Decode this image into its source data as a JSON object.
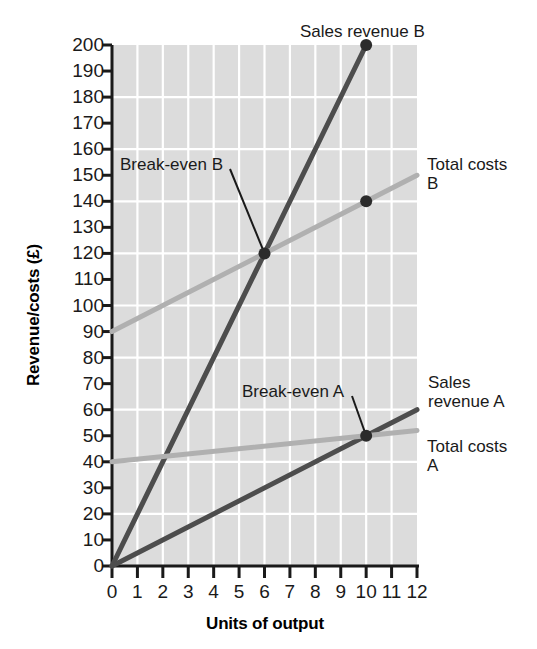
{
  "chart_data": {
    "type": "line",
    "title": "",
    "xlabel": "Units of output",
    "ylabel": "Revenue/costs (£)",
    "xlim": [
      0,
      12
    ],
    "ylim": [
      0,
      200
    ],
    "grid": true,
    "legend_position": "inline-labels",
    "x_ticks": [
      "0",
      "1",
      "2",
      "3",
      "4",
      "5",
      "6",
      "7",
      "8",
      "9",
      "10",
      "11",
      "12"
    ],
    "y_ticks": [
      "0",
      "10",
      "20",
      "30",
      "40",
      "50",
      "60",
      "70",
      "80",
      "90",
      "100",
      "110",
      "120",
      "130",
      "140",
      "150",
      "160",
      "170",
      "180",
      "190",
      "200"
    ],
    "series": [
      {
        "name": "Sales revenue B",
        "label": "Sales revenue B",
        "color": "#4d4d4d",
        "width": 5,
        "points": [
          [
            0,
            0
          ],
          [
            10,
            200
          ]
        ],
        "endpoint_marker": [
          10,
          200
        ]
      },
      {
        "name": "Total costs B",
        "label": "Total costs B",
        "color": "#b0b0b0",
        "width": 5,
        "points": [
          [
            0,
            90
          ],
          [
            12,
            150
          ]
        ],
        "endpoint_marker": [
          10,
          140
        ]
      },
      {
        "name": "Sales revenue A",
        "label": "Sales revenue A",
        "color": "#4d4d4d",
        "width": 5,
        "points": [
          [
            0,
            0
          ],
          [
            12,
            60
          ]
        ]
      },
      {
        "name": "Total costs A",
        "label": "Total costs A",
        "color": "#b0b0b0",
        "width": 5,
        "points": [
          [
            0,
            40
          ],
          [
            12,
            52
          ]
        ]
      }
    ],
    "annotations": [
      {
        "text": "Break-even B",
        "point": [
          6,
          120
        ],
        "label_x": 120,
        "label_y": 155
      },
      {
        "text": "Break-even A",
        "point": [
          10,
          50
        ],
        "label_x": 242,
        "label_y": 382
      }
    ],
    "inline_labels": [
      {
        "text": "Sales revenue B",
        "x": 300,
        "y": 22
      },
      {
        "text": "Total costs B",
        "x": 427,
        "y": 155
      },
      {
        "text": "Sales revenue A",
        "x": 428,
        "y": 373
      },
      {
        "text": "Total costs A",
        "x": 427,
        "y": 437
      }
    ],
    "colors": {
      "plot_background": "#dcdcdc",
      "gridline": "#ffffff",
      "axis": "#1a1a1a",
      "dark_series": "#4d4d4d",
      "light_series": "#b0b0b0"
    }
  }
}
